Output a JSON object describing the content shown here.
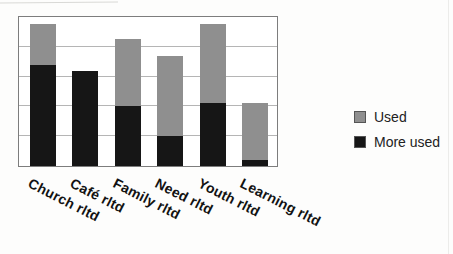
{
  "chart_data": {
    "type": "bar",
    "stacked": true,
    "title": "",
    "xlabel": "",
    "ylabel": "",
    "categories": [
      "Church rltd",
      "Café rltd",
      "Family rltd",
      "Need rltd",
      "Youth rltd",
      "Learning rltd"
    ],
    "series": [
      {
        "name": "More used",
        "color": "#161616",
        "values": [
          68,
          64,
          40,
          20,
          42,
          4
        ]
      },
      {
        "name": "Used",
        "color": "#8f8f8f",
        "values": [
          27,
          0,
          45,
          54,
          53,
          38
        ]
      }
    ],
    "ylim": [
      0,
      100
    ],
    "gridline_interval": 20,
    "grid": "horizontal",
    "axis_tick_labels_visible": false,
    "legend_position": "right"
  },
  "colors": {
    "used_fill": "#8f8f8f",
    "more_used_fill": "#161616",
    "plot_border": "#7d7d7d",
    "gridline": "#b5b5b5",
    "page_background": "#fdfdfc",
    "label_text": "#121212"
  }
}
